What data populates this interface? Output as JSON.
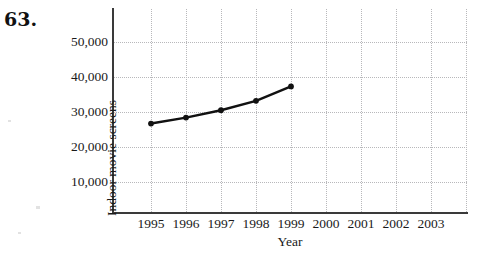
{
  "problem": {
    "number": "63."
  },
  "chart_data": {
    "type": "line",
    "title": "",
    "xlabel": "Year",
    "ylabel": "Indoor movie screens",
    "x": [
      1995,
      1996,
      1997,
      1998,
      1999
    ],
    "values": [
      26700,
      28400,
      30500,
      33200,
      37300
    ],
    "series": [
      {
        "name": "Indoor movie screens",
        "values": [
          26700,
          28400,
          30500,
          33200,
          37300
        ]
      }
    ],
    "xtick_labels": [
      "1995",
      "1996",
      "1997",
      "1998",
      "1999",
      "2000",
      "2001",
      "2002",
      "2003"
    ],
    "xticks": [
      1995,
      1996,
      1997,
      1998,
      1999,
      2000,
      2001,
      2002,
      2003
    ],
    "ytick_labels": [
      "10,000",
      "20,000",
      "30,000",
      "40,000",
      "50,000"
    ],
    "yticks": [
      10000,
      20000,
      30000,
      40000,
      50000
    ],
    "xlim": [
      1994.5,
      2003.6
    ],
    "ylim": [
      0,
      58500
    ],
    "grid": true,
    "legend": "none",
    "marker": "filled-circle",
    "line_color": "#111111",
    "grid_color": "#b8b8bb",
    "axis_color": "#3a3a3a"
  }
}
